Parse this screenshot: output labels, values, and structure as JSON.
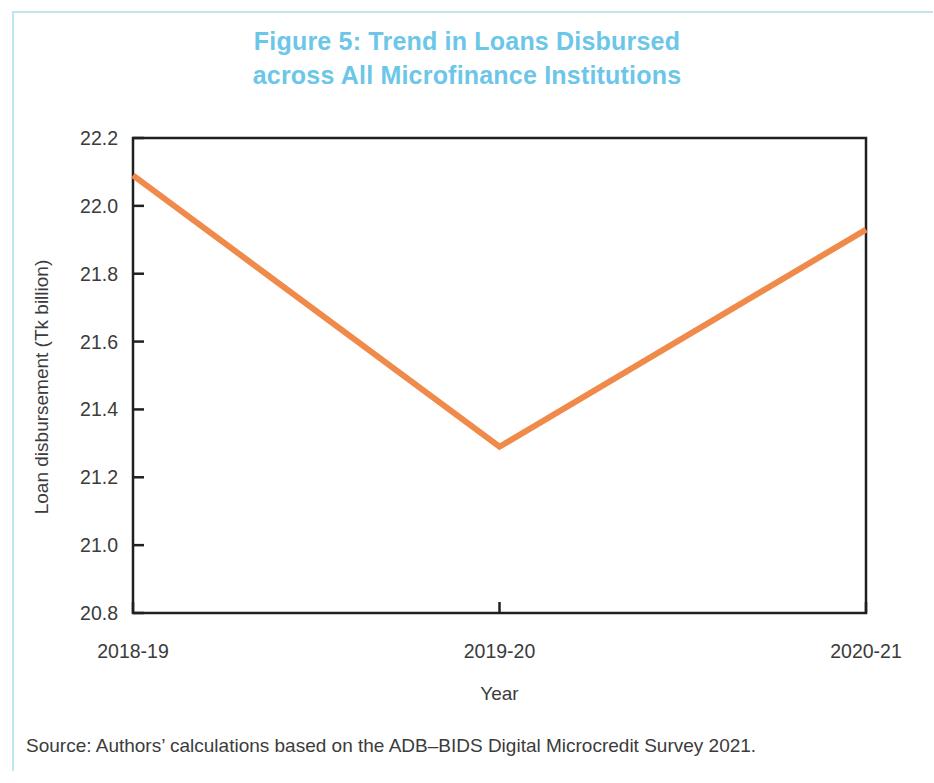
{
  "figure": {
    "title_line1": "Figure 5: Trend in Loans Disbursed",
    "title_line2": "across All Microfinance Institutions",
    "title_color": "#6bc6e8",
    "frame_color": "#bfe4f2",
    "source": "Source: Authors’ calculations based on the ADB–BIDS Digital Microcredit Survey 2021."
  },
  "chart_data": {
    "type": "line",
    "title": "Figure 5: Trend in Loans Disbursed across All Microfinance Institutions",
    "xlabel": "Year",
    "ylabel": "Loan disbursement (Tk billion)",
    "categories": [
      "2018-19",
      "2019-20",
      "2020-21"
    ],
    "values": [
      22.09,
      21.29,
      21.93
    ],
    "series": [
      {
        "name": "Loan disbursement",
        "values": [
          22.09,
          21.29,
          21.93
        ],
        "color": "#f08a4b"
      }
    ],
    "ylim": [
      20.8,
      22.2
    ],
    "yticks": [
      "20.8",
      "21.0",
      "21.2",
      "21.4",
      "21.6",
      "21.8",
      "22.0",
      "22.2"
    ],
    "ytick_values": [
      20.8,
      21.0,
      21.2,
      21.4,
      21.6,
      21.8,
      22.0,
      22.2
    ],
    "grid": false,
    "legend": "none",
    "line_color": "#f08a4b",
    "line_width": 6,
    "axis_color": "#231f20"
  }
}
